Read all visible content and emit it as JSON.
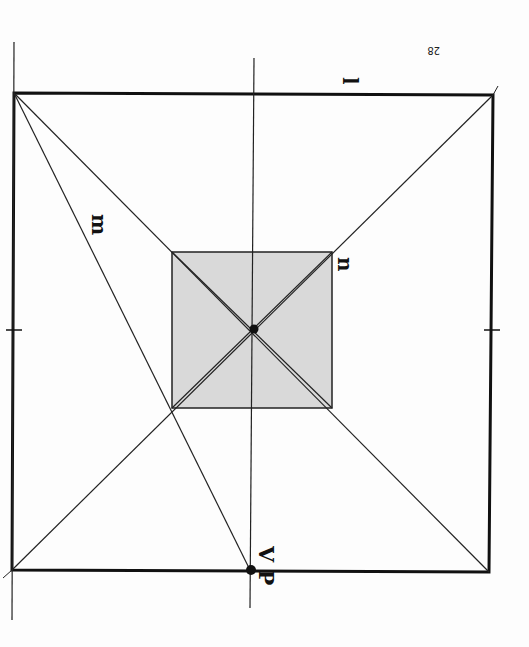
{
  "page_number": "28",
  "labels": {
    "l": "l",
    "m": "m",
    "n": "n",
    "vp": "V P"
  },
  "colors": {
    "ink": "#111111",
    "fill_square": "#d9d9d9",
    "background": "#fdfdfd"
  },
  "diagram": {
    "outer_square": {
      "x1": 13,
      "y1": 94,
      "x2": 491,
      "y2": 571
    },
    "inner_square": {
      "x1": 172,
      "y1": 252,
      "x2": 332,
      "y2": 408
    },
    "center_point": {
      "x": 253,
      "y": 329
    },
    "vanishing_point": {
      "x": 253,
      "y": 570
    }
  }
}
